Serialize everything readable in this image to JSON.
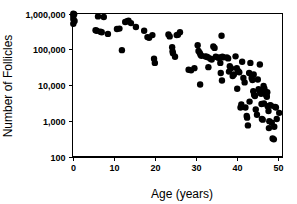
{
  "chart_data": {
    "type": "scatter",
    "title": "",
    "subtitle": "",
    "xlabel": "Age (years)",
    "ylabel": "Number of Follicles",
    "xlim": [
      0,
      51
    ],
    "ylim": [
      100,
      1000000
    ],
    "yscale": "log",
    "xscale": "linear",
    "grid": false,
    "legend": null,
    "legend_position": "none",
    "xticks": [
      0,
      10,
      20,
      30,
      40,
      50
    ],
    "xtick_labels": [
      "0",
      "10",
      "20",
      "30",
      "40",
      "50"
    ],
    "yticks": [
      100,
      1000,
      10000,
      100000,
      1000000
    ],
    "ytick_labels": [
      "100",
      "1,000",
      "10,000",
      "100,000",
      "1,000,000"
    ],
    "marker": "filled-circle",
    "marker_color": "#000000",
    "marker_size": 3.2,
    "frame": "full-box",
    "series": [
      {
        "name": "follicle-count",
        "points": [
          [
            0.2,
            980000
          ],
          [
            0.2,
            860000
          ],
          [
            0.2,
            700000
          ],
          [
            0.2,
            520000
          ],
          [
            0.4,
            950000
          ],
          [
            0.5,
            620000
          ],
          [
            5.6,
            340000
          ],
          [
            5.9,
            330000
          ],
          [
            6.2,
            830000
          ],
          [
            6.8,
            310000
          ],
          [
            7.1,
            300000
          ],
          [
            7.6,
            800000
          ],
          [
            8.6,
            270000
          ],
          [
            10.8,
            370000
          ],
          [
            11.4,
            380000
          ],
          [
            12.0,
            95000
          ],
          [
            12.8,
            580000
          ],
          [
            13.3,
            610000
          ],
          [
            13.6,
            630000
          ],
          [
            14.2,
            540000
          ],
          [
            15.4,
            420000
          ],
          [
            17.4,
            330000
          ],
          [
            18.2,
            220000
          ],
          [
            18.6,
            210000
          ],
          [
            19.4,
            250000
          ],
          [
            19.8,
            55000
          ],
          [
            20.0,
            42000
          ],
          [
            23.3,
            260000
          ],
          [
            23.6,
            230000
          ],
          [
            24.2,
            115000
          ],
          [
            24.3,
            88000
          ],
          [
            24.4,
            78000
          ],
          [
            24.9,
            62000
          ],
          [
            25.3,
            250000
          ],
          [
            25.6,
            255000
          ],
          [
            26.1,
            300000
          ],
          [
            28.2,
            27000
          ],
          [
            28.8,
            26000
          ],
          [
            29.6,
            30000
          ],
          [
            30.4,
            130000
          ],
          [
            30.6,
            90000
          ],
          [
            30.9,
            80000
          ],
          [
            31.1,
            71000
          ],
          [
            31.3,
            66000
          ],
          [
            31.0,
            10500
          ],
          [
            32.2,
            64000
          ],
          [
            32.6,
            62000
          ],
          [
            32.9,
            60000
          ],
          [
            33.0,
            32000
          ],
          [
            33.5,
            55000
          ],
          [
            33.8,
            52000
          ],
          [
            34.2,
            120000
          ],
          [
            34.5,
            110000
          ],
          [
            34.8,
            62000
          ],
          [
            35.4,
            58000
          ],
          [
            35.7,
            60000
          ],
          [
            35.9,
            42000
          ],
          [
            36.2,
            240000
          ],
          [
            36.4,
            62000
          ],
          [
            36.7,
            60000
          ],
          [
            36.0,
            22000
          ],
          [
            36.3,
            13500
          ],
          [
            37.5,
            60000
          ],
          [
            37.8,
            56000
          ],
          [
            38.2,
            34000
          ],
          [
            38.5,
            30000
          ],
          [
            38.9,
            18000
          ],
          [
            39.6,
            64000
          ],
          [
            39.9,
            30000
          ],
          [
            40.2,
            25000
          ],
          [
            40.5,
            23000
          ],
          [
            40.0,
            8000
          ],
          [
            41.2,
            45000
          ],
          [
            41.5,
            16000
          ],
          [
            41.8,
            12000
          ],
          [
            42.0,
            2400
          ],
          [
            42.3,
            1400
          ],
          [
            42.4,
            1250
          ],
          [
            42.6,
            760
          ],
          [
            42.9,
            22000
          ],
          [
            43.2,
            42000
          ],
          [
            43.5,
            16000
          ],
          [
            43.7,
            14000
          ],
          [
            43.9,
            6800
          ],
          [
            44.1,
            5400
          ],
          [
            44.3,
            5000
          ],
          [
            44.5,
            2100
          ],
          [
            44.8,
            1500
          ],
          [
            45.0,
            14500
          ],
          [
            45.2,
            7800
          ],
          [
            45.4,
            7000
          ],
          [
            45.6,
            6200
          ],
          [
            45.8,
            5800
          ],
          [
            45.9,
            3000
          ],
          [
            46.0,
            1150
          ],
          [
            46.2,
            1100
          ],
          [
            46.4,
            9500
          ],
          [
            46.6,
            8200
          ],
          [
            46.8,
            6500
          ],
          [
            46.9,
            6000
          ],
          [
            47.0,
            5500
          ],
          [
            47.1,
            5200
          ],
          [
            47.2,
            4800
          ],
          [
            47.3,
            6400
          ],
          [
            47.4,
            2600
          ],
          [
            47.6,
            1900
          ],
          [
            47.8,
            1000
          ],
          [
            48.0,
            2800
          ],
          [
            48.2,
            2700
          ],
          [
            48.4,
            900
          ],
          [
            48.6,
            330
          ],
          [
            48.9,
            310
          ],
          [
            49.2,
            2500
          ],
          [
            49.4,
            2400
          ],
          [
            49.6,
            1150
          ],
          [
            50.2,
            1700
          ],
          [
            43.0,
            3500
          ],
          [
            44.0,
            20000
          ],
          [
            45.5,
            38000
          ],
          [
            46.5,
            3100
          ],
          [
            47.7,
            640
          ],
          [
            49.0,
            700
          ],
          [
            41.0,
            2900
          ],
          [
            40.8,
            2400
          ],
          [
            39.2,
            20000
          ],
          [
            38.0,
            24000
          ]
        ]
      }
    ]
  },
  "axes": {
    "x_axis_name": "age-axis",
    "y_axis_name": "follicle-count-axis"
  }
}
